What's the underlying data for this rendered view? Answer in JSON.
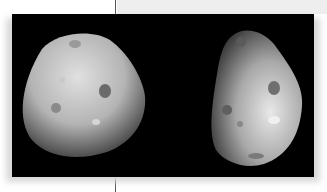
{
  "figure": {
    "caption": "",
    "panels": [
      {
        "label": "left-view",
        "description": "Deimos, lit from upper-left, rounded lumpy shape with craters"
      },
      {
        "label": "right-view",
        "description": "Deimos, triangular shape lit from right, with several craters"
      }
    ],
    "colors": {
      "background": "#000000",
      "page": "#ffffff",
      "band": "#eeeeee",
      "rule": "#555555"
    }
  }
}
